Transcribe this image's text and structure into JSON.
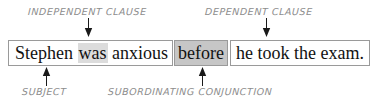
{
  "diagram": {
    "type": "sentence-clause-annotation",
    "sentence_full": "Stephen was anxious before he took the exam.",
    "boxes": {
      "independent_clause": {
        "words": [
          {
            "text": "Stephen",
            "highlight": "none"
          },
          {
            "text": "was",
            "highlight": "light-gray"
          },
          {
            "text": "anxious",
            "highlight": "none"
          }
        ],
        "text": "Stephen was anxious"
      },
      "subordinating_conjunction": {
        "text": "before",
        "highlight": "dark-gray"
      },
      "dependent_clause": {
        "text": "he took the exam."
      }
    },
    "labels": {
      "independent_clause": "INDEPENDENT CLAUSE",
      "dependent_clause": "DEPENDENT CLAUSE",
      "subject": "SUBJECT",
      "subordinating_conjunction": "SUBORDINATING CONJUNCTION"
    },
    "arrows": {
      "independent_clause": "arrow-down",
      "dependent_clause": "arrow-down",
      "subject": "arrow-up",
      "subordinating_conjunction": "arrow-up"
    },
    "colors": {
      "label_text": "#8d8d8d",
      "sentence_text": "#121212",
      "box_border": "#9a9a9a",
      "highlight_light": "#dcdcdc",
      "highlight_dark": "#c6c6c6",
      "arrow": "#1a1a1a",
      "background": "#ffffff"
    }
  }
}
